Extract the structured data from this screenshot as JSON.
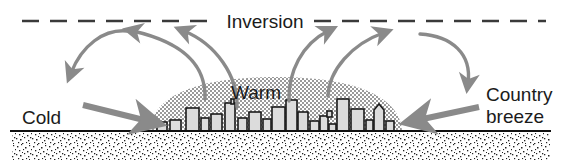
{
  "figure": {
    "type": "schematic-cross-section",
    "background_color": "#ffffff"
  },
  "labels": {
    "inversion": "Inversion",
    "warm": "Warm",
    "cold": "Cold",
    "country_line1": "Country",
    "country_line2": "breeze"
  },
  "colors": {
    "ink": "#1b1b1b",
    "arrow": "#8a8a8a",
    "dome_fill": "#b5b5b5",
    "ground_line": "#111111",
    "stipple": "#2a2a2a",
    "building_fill": "#d8d8d8"
  },
  "elements": {
    "inversion_line": {
      "name": "inversion-dashed-line",
      "style": "dashed",
      "y": 21,
      "x_start": 22,
      "x_end": 545,
      "gap_for_label": [
        218,
        312
      ]
    },
    "ground_line": {
      "name": "ground-surface-line",
      "y": 131,
      "x_start": 10,
      "x_end": 551
    },
    "stipple_band": {
      "name": "ground-stipple-band",
      "y_top": 133,
      "y_bottom": 160,
      "x_start": 12,
      "x_end": 550
    },
    "heat_dome": {
      "name": "warm-air-dome",
      "x_left": 150,
      "x_right": 402,
      "apex_y": 77,
      "base_y": 131
    },
    "skyline": {
      "name": "city-skyline",
      "x_start": 156,
      "x_end": 398,
      "base_y": 131
    }
  },
  "arrows": [
    {
      "id": "arrow-updraft-left-inner",
      "name": "updraft-arrow-left-inner",
      "direction": "up-left",
      "from": [
        204,
        98
      ],
      "to": [
        127,
        26
      ]
    },
    {
      "id": "arrow-updraft-left-outer",
      "name": "updraft-arrow-left-outer",
      "direction": "up-left",
      "from": [
        236,
        106
      ],
      "to": [
        179,
        26
      ]
    },
    {
      "id": "arrow-updraft-right-inner",
      "name": "updraft-arrow-right-inner",
      "direction": "up-right",
      "from": [
        289,
        100
      ],
      "to": [
        333,
        26
      ]
    },
    {
      "id": "arrow-updraft-right-outer",
      "name": "updraft-arrow-right-outer",
      "direction": "up-right",
      "from": [
        327,
        95
      ],
      "to": [
        388,
        29
      ]
    },
    {
      "id": "arrow-descent-left",
      "name": "descending-arrow-left",
      "direction": "down-left",
      "from": [
        126,
        30
      ],
      "to": [
        66,
        79
      ]
    },
    {
      "id": "arrow-descent-right",
      "name": "descending-arrow-right",
      "direction": "down-right",
      "from": [
        420,
        33
      ],
      "to": [
        471,
        90
      ]
    },
    {
      "id": "arrow-inflow-left",
      "name": "country-breeze-inflow-left",
      "direction": "right",
      "from": [
        82,
        104
      ],
      "to": [
        158,
        124
      ]
    },
    {
      "id": "arrow-inflow-right",
      "name": "country-breeze-inflow-right",
      "direction": "left",
      "from": [
        480,
        106
      ],
      "to": [
        408,
        122
      ]
    }
  ]
}
